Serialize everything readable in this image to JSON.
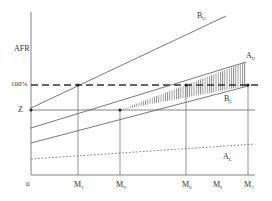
{
  "diagram": {
    "type": "economic line diagram",
    "y_axis": {
      "label": "AFR",
      "ticks": [
        {
          "label": "100%",
          "y": 85
        },
        {
          "label": "Z",
          "y": 110
        }
      ]
    },
    "x_axis": {
      "origin_label": "0",
      "ticks": [
        {
          "main": "M",
          "sub": "1",
          "x": 78
        },
        {
          "main": "M",
          "sub": "9",
          "x": 120
        },
        {
          "main": "M",
          "sub": "6",
          "x": 186
        },
        {
          "main": "M",
          "sub": "I",
          "x": 217
        },
        {
          "main": "M",
          "sub": "7",
          "x": 248
        }
      ]
    },
    "lines": [
      {
        "name": "B_U",
        "main": "B",
        "sub": "U",
        "style": "solid"
      },
      {
        "name": "A_U",
        "main": "A",
        "sub": "U",
        "style": "solid"
      },
      {
        "name": "B_L",
        "main": "B",
        "sub": "L",
        "style": "solid"
      },
      {
        "name": "A_L",
        "main": "A",
        "sub": "L",
        "style": "dashed"
      }
    ],
    "reference_lines": [
      {
        "name": "100% level",
        "style": "thick dashed"
      },
      {
        "name": "Z level",
        "style": "solid"
      }
    ],
    "shaded_region": "vertical hatching between A_U and B_L from M9 to M7",
    "colors": {
      "line": "#555555",
      "text": "#333333",
      "background": "#ffffff"
    }
  }
}
